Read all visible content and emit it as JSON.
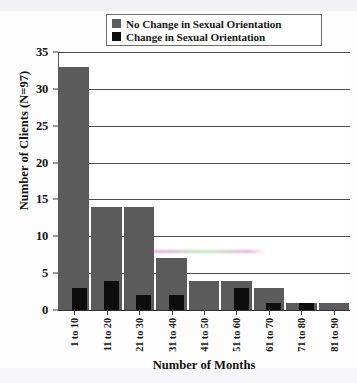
{
  "chart_data": {
    "type": "bar",
    "title": "",
    "subtitle": "",
    "xlabel": "Number of Months",
    "ylabel": "Number of Clients (N=97)",
    "categories": [
      "1 to 10",
      "11 to 20",
      "21 to 30",
      "31 to 40",
      "41 to 50",
      "51 to 60",
      "61 to 70",
      "71 to 80",
      "81 to 90"
    ],
    "series": [
      {
        "name": "No Change in Sexual Orientation",
        "color": "#5b5b5b",
        "values": [
          33,
          14,
          14,
          7,
          4,
          4,
          3,
          1,
          1
        ]
      },
      {
        "name": "Change in Sexual Orientation",
        "color": "#0d0d0d",
        "values": [
          3,
          4,
          2,
          2,
          0,
          3,
          1,
          1,
          0
        ]
      }
    ],
    "stacked": false,
    "overlapping_bars": true,
    "ylim": [
      0,
      35
    ],
    "yticks": [
      0,
      5,
      10,
      15,
      20,
      25,
      30,
      35
    ],
    "ytick_labels": [
      "0",
      "5",
      "10",
      "15",
      "20",
      "25",
      "30",
      "35"
    ],
    "grid": true,
    "grid_axis": "y",
    "legend_position": "top-center"
  },
  "legend": {
    "items": [
      {
        "label": "No Change in Sexual Orientation",
        "color": "#5b5b5b",
        "swatch": "square-swatch"
      },
      {
        "label": "Change in Sexual Orientation",
        "color": "#0d0d0d",
        "swatch": "square-swatch"
      }
    ]
  },
  "axes": {
    "y": {
      "title": "Number of Clients (N=97)",
      "ticks": [
        "0",
        "5",
        "10",
        "15",
        "20",
        "25",
        "30",
        "35"
      ]
    },
    "x": {
      "title": "Number of Months",
      "ticks": [
        "1 to 10",
        "11 to 20",
        "21 to 30",
        "31 to 40",
        "41 to 50",
        "51 to 60",
        "61 to 70",
        "71 to 80",
        "81 to 90"
      ]
    }
  }
}
